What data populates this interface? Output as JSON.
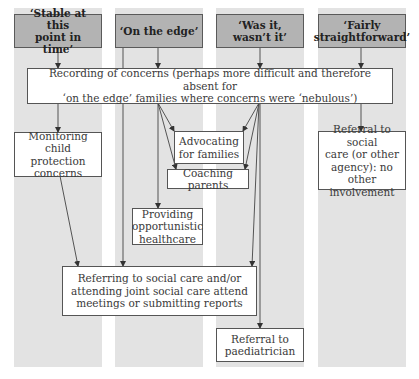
{
  "columns": [
    {
      "header": "‘Stable at this\npoint in time’"
    },
    {
      "header": "‘On the edge’"
    },
    {
      "header": "‘Was it, wasn’t it’"
    },
    {
      "header": "‘Fairly\nstraightforward’"
    }
  ],
  "nodes": {
    "recording": "Recording of concerns (perhaps more difficult and therefore absent for\n‘on the edge’ families where concerns were ‘nebulous’)",
    "monitoring": "Monitoring\nchild protection\nconcerns",
    "advocating": "Advocating\nfor families",
    "coaching": "Coaching parents",
    "providing": "Providing\nopportunistic\nhealthcare",
    "referral_social_care": "Referral to social\ncare (or other\nagency): no other\ninvolvement",
    "referring": "Referring to social care and/or\nattending joint social care attend\nmeetings or submitting reports",
    "referral_paediatrician": "Referral to\npaediatrician"
  },
  "edges": [
    {
      "from": "‘Stable at this point in time’",
      "to": "Recording of concerns"
    },
    {
      "from": "‘On the edge’",
      "to": "Recording of concerns"
    },
    {
      "from": "‘On the edge’",
      "to": "Referring to social care"
    },
    {
      "from": "‘Was it, wasn’t it’",
      "to": "Recording of concerns"
    },
    {
      "from": "‘Fairly straightforward’",
      "to": "Recording of concerns"
    },
    {
      "from": "Recording of concerns",
      "to": "Monitoring child protection concerns"
    },
    {
      "from": "Recording of concerns",
      "to": "Advocating for families"
    },
    {
      "from": "Recording of concerns",
      "to": "Coaching parents"
    },
    {
      "from": "Recording of concerns",
      "to": "Providing opportunistic healthcare"
    },
    {
      "from": "Recording of concerns",
      "to": "Referring to social care"
    },
    {
      "from": "Recording of concerns",
      "to": "Referral to paediatrician"
    },
    {
      "from": "Recording of concerns",
      "to": "Referral to social care (or other agency)"
    },
    {
      "from": "Monitoring child protection concerns",
      "to": "Referring to social care"
    }
  ],
  "colors": {
    "column_background": "#e3e3e3",
    "header_fill": "#b3b3b3",
    "box_fill": "#ffffff",
    "stroke": "#555555"
  }
}
